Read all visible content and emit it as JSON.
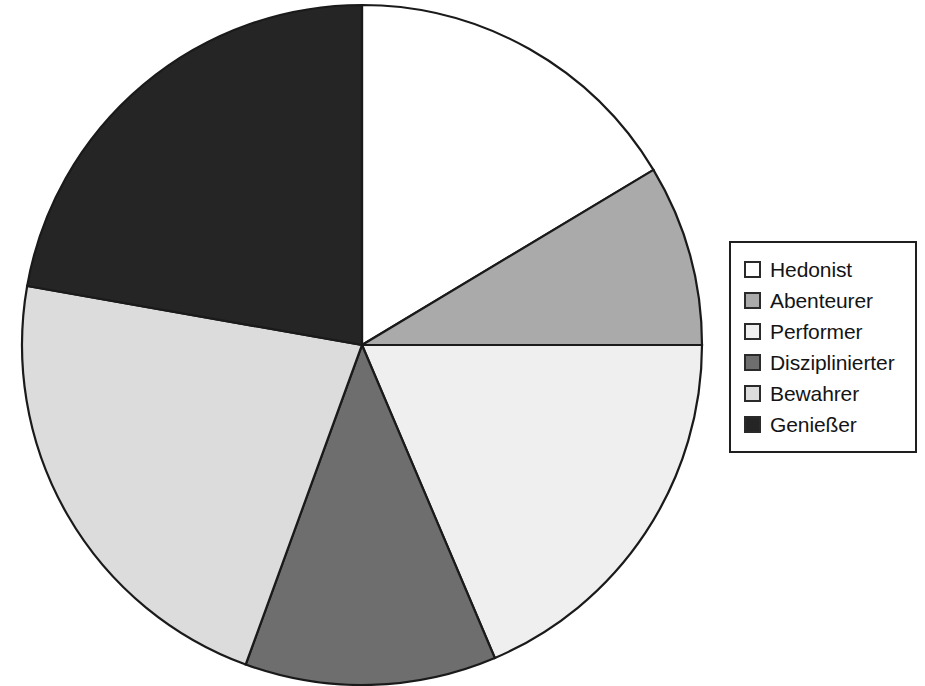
{
  "chart_data": {
    "type": "pie",
    "title": "",
    "subtitle": "",
    "xlabel": "",
    "ylabel": "",
    "grid": false,
    "legend_position": "right",
    "start_angle_deg": 0,
    "direction": "clockwise",
    "categories": [
      "Hedonist",
      "Abenteurer",
      "Performer",
      "Disziplinierter",
      "Bewahrer",
      "Genießer"
    ],
    "values": [
      16.4,
      8.6,
      18.6,
      11.9,
      22.2,
      22.3
    ],
    "angles_deg": [
      59,
      31,
      67,
      43,
      80,
      80
    ],
    "colors": [
      "#ffffff",
      "#aaaaaa",
      "#efefef",
      "#6e6e6e",
      "#dcdcdc",
      "#252525"
    ],
    "slices": [
      {
        "label": "Hedonist",
        "value": 16.4,
        "angle_deg": 59,
        "color": "#ffffff"
      },
      {
        "label": "Abenteurer",
        "value": 8.6,
        "angle_deg": 31,
        "color": "#aaaaaa"
      },
      {
        "label": "Performer",
        "value": 18.6,
        "angle_deg": 67,
        "color": "#efefef"
      },
      {
        "label": "Disziplinierter",
        "value": 11.9,
        "angle_deg": 43,
        "color": "#6e6e6e"
      },
      {
        "label": "Bewahrer",
        "value": 22.2,
        "angle_deg": 80,
        "color": "#dcdcdc"
      },
      {
        "label": "Genießer",
        "value": 22.3,
        "angle_deg": 80,
        "color": "#252525"
      }
    ],
    "geometry": {
      "center_x": 362,
      "center_y": 345,
      "radius": 340
    },
    "stroke_color": "#1a1a1a"
  },
  "legend": {
    "items": [
      {
        "label": "Hedonist",
        "color": "#ffffff"
      },
      {
        "label": "Abenteurer",
        "color": "#aaaaaa"
      },
      {
        "label": "Performer",
        "color": "#efefef"
      },
      {
        "label": "Disziplinierter",
        "color": "#6e6e6e"
      },
      {
        "label": "Bewahrer",
        "color": "#dcdcdc"
      },
      {
        "label": "Genießer",
        "color": "#252525"
      }
    ]
  }
}
